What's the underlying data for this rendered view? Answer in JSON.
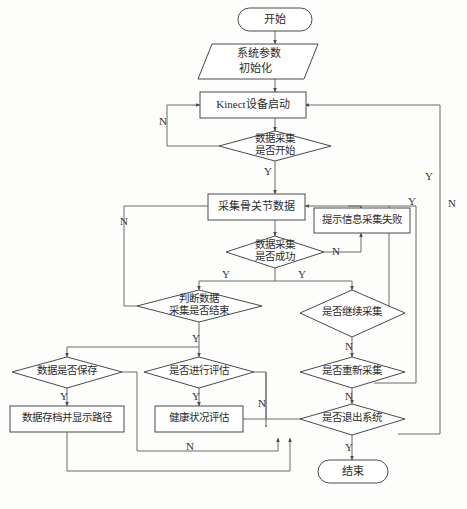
{
  "diagram": {
    "type": "flowchart",
    "stroke_color": "#4a4a4a",
    "connector_color": "#6a6a6a",
    "fill_color": "#ffffff",
    "background": "#fdfdfb"
  },
  "nodes": {
    "start": {
      "label": "开始",
      "shape": "terminator"
    },
    "init": {
      "line1": "系统参数",
      "line2": "初始化",
      "shape": "parallelogram"
    },
    "kinect_start": {
      "label": "Kinect设备启动",
      "shape": "process"
    },
    "acq_begin": {
      "line1": "数据采集",
      "line2": "是否开始",
      "shape": "decision"
    },
    "collect_joint": {
      "label": "采集骨关节数据",
      "shape": "process"
    },
    "acq_success": {
      "line1": "数据采集",
      "line2": "是否成功",
      "shape": "decision"
    },
    "fail_msg": {
      "label": "提示信息采集失败",
      "shape": "process"
    },
    "judge_end": {
      "line1": "判断数据",
      "line2": "采集是否结束",
      "shape": "decision"
    },
    "continue_acq": {
      "label": "是否继续采集",
      "shape": "decision"
    },
    "save_data": {
      "label": "数据是否保存",
      "shape": "decision"
    },
    "do_eval": {
      "label": "是否进行评估",
      "shape": "decision"
    },
    "reacquire": {
      "label": "是否重新采集",
      "shape": "decision"
    },
    "archive": {
      "label": "数据存档并显示路径",
      "shape": "process"
    },
    "health_eval": {
      "label": "健康状况评估",
      "shape": "process"
    },
    "exit_sys": {
      "label": "是否退出系统",
      "shape": "decision"
    },
    "end": {
      "label": "结束",
      "shape": "terminator"
    }
  },
  "edge_labels": {
    "acq_begin_no": "N",
    "acq_begin_yes": "Y",
    "acq_success_no": "N",
    "acq_success_yes_left": "Y",
    "acq_success_yes_right": "Y",
    "judge_end_no": "N",
    "judge_end_yes": "Y",
    "save_data_yes": "Y",
    "do_eval_yes": "Y",
    "do_eval_no": "N",
    "archive_no": "N",
    "continue_acq_no": "N",
    "continue_acq_yes": "Y",
    "reacquire_no": "N",
    "reacquire_yes": "Y",
    "exit_sys_yes": "Y",
    "exit_sys_no": "N",
    "fail_loop_yes": "Y"
  }
}
